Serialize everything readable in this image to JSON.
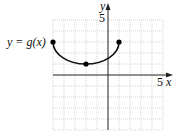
{
  "chart_data": {
    "type": "line",
    "title": "",
    "xlabel": "x",
    "ylabel": "y",
    "xlim": [
      -5,
      5
    ],
    "ylim": [
      -5,
      5
    ],
    "grid": true,
    "grid_step": 1,
    "tick_labels": {
      "x": [
        "5"
      ],
      "y": [
        "5"
      ]
    },
    "series": [
      {
        "name": "y = g(x)",
        "description": "lower half of ellipse centered at (-2, 3), horizontal radius 3, vertical radius 2",
        "x": [
          -5,
          -2,
          1
        ],
        "y": [
          3,
          1,
          3
        ],
        "marked_points": [
          [
            -5,
            3
          ],
          [
            -2,
            1
          ],
          [
            1,
            3
          ]
        ],
        "endpoints": "closed"
      }
    ],
    "annotations": [
      {
        "text": "y = g(x)",
        "at": [
          -5,
          3
        ],
        "position": "left"
      }
    ]
  },
  "labels": {
    "curve_label_prefix": "y = g",
    "curve_label_arg": "(x)",
    "x_axis": "x",
    "y_axis": "y",
    "x_tick": "5",
    "y_tick": "5"
  }
}
